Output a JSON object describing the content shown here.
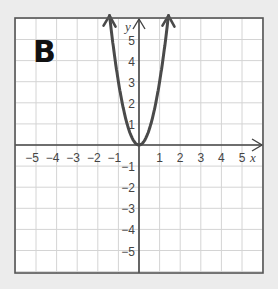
{
  "panel_label": "B",
  "colors": {
    "background": "#ececec",
    "plot_bg": "#ffffff",
    "grid": "#d4d4d4",
    "axis": "#444444",
    "frame": "#555555",
    "curve": "#4a4a4a"
  },
  "chart_data": {
    "type": "line",
    "title": "",
    "xlabel": "x",
    "ylabel": "y",
    "xlim": [
      -6,
      6
    ],
    "ylim": [
      -6,
      6.2
    ],
    "grid": true,
    "x_ticks": [
      -5,
      -4,
      -3,
      -2,
      -1,
      1,
      2,
      3,
      4,
      5
    ],
    "x_tick_labels": [
      "−5",
      "−4",
      "−3",
      "−2",
      "−1",
      "1",
      "2",
      "3",
      "4",
      "5"
    ],
    "y_ticks": [
      5,
      4,
      3,
      2,
      1,
      -1,
      -2,
      -3,
      -4,
      -5
    ],
    "y_tick_labels": [
      "5",
      "4",
      "3",
      "2",
      "1",
      "−1",
      "−2",
      "−3",
      "−4",
      "−5"
    ],
    "series": [
      {
        "name": "parabola",
        "equation": "y = 3x^2",
        "x": [
          -1.45,
          -1.2,
          -1.0,
          -0.8,
          -0.6,
          -0.4,
          -0.2,
          0,
          0.2,
          0.4,
          0.6,
          0.8,
          1.0,
          1.2,
          1.45
        ],
        "y": [
          6.3,
          4.32,
          3.0,
          1.92,
          1.08,
          0.48,
          0.12,
          0,
          0.12,
          0.48,
          1.08,
          1.92,
          3.0,
          4.32,
          6.3
        ],
        "arrows": "both ends"
      }
    ]
  }
}
